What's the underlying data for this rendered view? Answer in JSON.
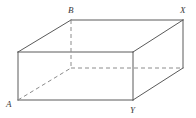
{
  "figure": {
    "kind": "geometry-diagram",
    "width": 196,
    "height": 118,
    "background_color": "#ffffff",
    "edge_color": "#5a5a5a",
    "hidden_edge_color": "#8c8c8c",
    "label_color": "#3a3a3a",
    "edge_width": 1,
    "vertices": [
      {
        "id": "front-top-left",
        "label": "",
        "x": 18,
        "y": 52
      },
      {
        "id": "front-top-right",
        "label": "",
        "x": 133,
        "y": 52
      },
      {
        "id": "front-bottom-left",
        "label": "A",
        "x": 18,
        "y": 100
      },
      {
        "id": "front-bottom-right",
        "label": "Y",
        "x": 133,
        "y": 100
      },
      {
        "id": "back-top-left",
        "label": "B",
        "x": 71,
        "y": 20
      },
      {
        "id": "back-top-right",
        "label": "X",
        "x": 183,
        "y": 20
      },
      {
        "id": "back-bottom-left",
        "label": "",
        "x": 71,
        "y": 68
      },
      {
        "id": "back-bottom-right",
        "label": "",
        "x": 183,
        "y": 68
      }
    ],
    "solid_edges": [
      {
        "id": "edge-front-top",
        "from": "front-top-left",
        "to": "front-top-right"
      },
      {
        "id": "edge-front-bottom",
        "from": "front-bottom-left",
        "to": "front-bottom-right"
      },
      {
        "id": "edge-front-left",
        "from": "front-top-left",
        "to": "front-bottom-left"
      },
      {
        "id": "edge-front-right",
        "from": "front-top-right",
        "to": "front-bottom-right"
      },
      {
        "id": "edge-top-back",
        "from": "back-top-left",
        "to": "back-top-right"
      },
      {
        "id": "edge-top-left-diagonal",
        "from": "front-top-left",
        "to": "back-top-left"
      },
      {
        "id": "edge-top-right-diagonal",
        "from": "front-top-right",
        "to": "back-top-right"
      },
      {
        "id": "edge-back-right-vertical",
        "from": "back-top-right",
        "to": "back-bottom-right"
      },
      {
        "id": "edge-bottom-right-diagonal",
        "from": "front-bottom-right",
        "to": "back-bottom-right"
      }
    ],
    "hidden_edges": [
      {
        "id": "hidden-back-left-vertical",
        "from": "back-top-left",
        "to": "back-bottom-left"
      },
      {
        "id": "hidden-bottom-back",
        "from": "back-bottom-left",
        "to": "back-bottom-right"
      },
      {
        "id": "hidden-bottom-left-diagonal",
        "from": "front-bottom-left",
        "to": "back-bottom-left"
      }
    ],
    "labels": [
      {
        "id": "label-B",
        "text": "B",
        "x": 68,
        "y": 6,
        "anchor": "vertex:back-top-left"
      },
      {
        "id": "label-X",
        "text": "X",
        "x": 180,
        "y": 6,
        "anchor": "vertex:back-top-right"
      },
      {
        "id": "label-A",
        "text": "A",
        "x": 6,
        "y": 100,
        "anchor": "vertex:front-bottom-left"
      },
      {
        "id": "label-Y",
        "text": "Y",
        "x": 130,
        "y": 106,
        "anchor": "vertex:front-bottom-right"
      }
    ]
  }
}
